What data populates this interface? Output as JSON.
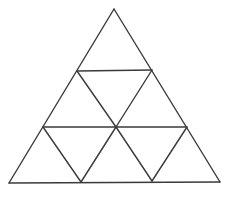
{
  "diagram": {
    "type": "subdivided-triangle",
    "background": "#ffffff",
    "stroke_color": "#3a3a3a",
    "stroke_width": 1.4,
    "vertices": {
      "apex": [
        114,
        9
      ],
      "bottom_left": [
        9,
        183
      ],
      "bottom_right": [
        220,
        182
      ],
      "row1_left": [
        77,
        71
      ],
      "row1_right": [
        152,
        70
      ],
      "row2_left": [
        43,
        127
      ],
      "row2_center": [
        116,
        127
      ],
      "row2_right": [
        187,
        127
      ],
      "base_left_mid": [
        81,
        182
      ],
      "base_right_mid": [
        152,
        181
      ]
    },
    "segments": [
      {
        "name": "outer-left-edge",
        "from": [
          114,
          9
        ],
        "to": [
          9,
          183
        ]
      },
      {
        "name": "outer-right-edge",
        "from": [
          114,
          9
        ],
        "to": [
          220,
          182
        ]
      },
      {
        "name": "outer-base",
        "from": [
          9,
          183
        ],
        "to": [
          220,
          182
        ]
      },
      {
        "name": "row1-horizontal",
        "from": [
          77,
          71
        ],
        "to": [
          152,
          70
        ]
      },
      {
        "name": "row2-horizontal",
        "from": [
          43,
          127
        ],
        "to": [
          187,
          127
        ]
      },
      {
        "name": "row1-inner-left",
        "from": [
          77,
          71
        ],
        "to": [
          116,
          127
        ]
      },
      {
        "name": "row1-inner-right",
        "from": [
          152,
          70
        ],
        "to": [
          116,
          127
        ]
      },
      {
        "name": "row2-inner-a",
        "from": [
          43,
          127
        ],
        "to": [
          81,
          182
        ]
      },
      {
        "name": "row2-inner-b",
        "from": [
          116,
          127
        ],
        "to": [
          81,
          182
        ]
      },
      {
        "name": "row2-inner-c",
        "from": [
          116,
          127
        ],
        "to": [
          152,
          181
        ]
      },
      {
        "name": "row2-inner-d",
        "from": [
          187,
          127
        ],
        "to": [
          152,
          181
        ]
      }
    ]
  }
}
